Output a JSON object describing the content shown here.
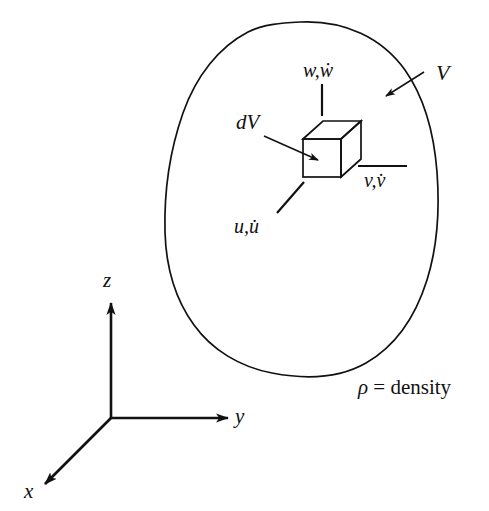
{
  "figure": {
    "background_color": "#ffffff",
    "line_color": "#111111"
  },
  "body_region": {
    "name": "volume-outline",
    "label": "V",
    "description": "closed irregular blob outline representing the body volume"
  },
  "element": {
    "name": "dV",
    "label": "dV",
    "description": "infinitesimal cubic volume element drawn in isometric projection"
  },
  "velocities": [
    {
      "key": "w",
      "label": "w,ẇ",
      "direction": "z",
      "leader": "vertical"
    },
    {
      "key": "v",
      "label": "v,v̇",
      "direction": "y",
      "leader": "horizontal"
    },
    {
      "key": "u",
      "label": "u,u̇",
      "direction": "x",
      "leader": "diagonal"
    }
  ],
  "axes": [
    {
      "key": "z",
      "label": "z",
      "direction": "up"
    },
    {
      "key": "y",
      "label": "y",
      "direction": "right"
    },
    {
      "key": "x",
      "label": "x",
      "direction": "down-left"
    }
  ],
  "annotations": {
    "density": {
      "symbol": "ρ",
      "equals": " = ",
      "text": "density",
      "full": "ρ = density"
    }
  }
}
